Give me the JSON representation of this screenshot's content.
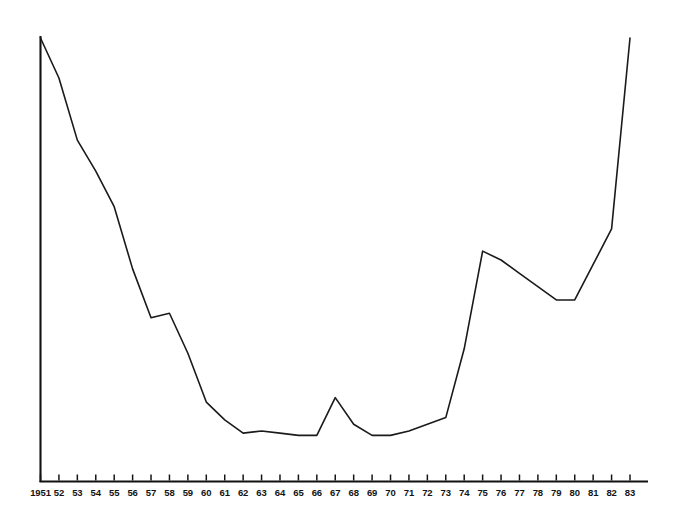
{
  "figure": {
    "background_color": "#ffffff",
    "line_color": "#1a1a1a",
    "axis_color": "#111111",
    "line_width": 1.6,
    "axis_width": 2.0
  },
  "chart_data": {
    "type": "line",
    "title": "",
    "subtitle": "",
    "xlabel": "",
    "ylabel": "",
    "grid": false,
    "legend": null,
    "legend_position": "none",
    "y_axis_labeled": false,
    "y_axis_ticks": [],
    "axis_style": {
      "left_spine": true,
      "bottom_spine": true,
      "top_spine": false,
      "right_spine": false,
      "tick_direction": "up"
    },
    "x_tick_labels": [
      "1951",
      "52",
      "53",
      "54",
      "55",
      "56",
      "57",
      "58",
      "59",
      "60",
      "61",
      "62",
      "63",
      "64",
      "65",
      "66",
      "67",
      "68",
      "69",
      "70",
      "71",
      "72",
      "73",
      "74",
      "75",
      "76",
      "77",
      "78",
      "79",
      "80",
      "81",
      "82",
      "83"
    ],
    "x": [
      1951,
      1952,
      1953,
      1954,
      1955,
      1956,
      1957,
      1958,
      1959,
      1960,
      1961,
      1962,
      1963,
      1964,
      1965,
      1966,
      1967,
      1968,
      1969,
      1970,
      1971,
      1972,
      1973,
      1974,
      1975,
      1976,
      1977,
      1978,
      1979,
      1980,
      1981,
      1982,
      1983
    ],
    "xlim": [
      1951,
      1983
    ],
    "ylim": [
      0,
      100
    ],
    "values": [
      100.0,
      91.0,
      77.0,
      70.0,
      62.0,
      48.0,
      37.0,
      38.0,
      29.0,
      18.0,
      14.0,
      11.0,
      11.5,
      11.0,
      10.5,
      10.5,
      19.0,
      13.0,
      10.5,
      10.5,
      11.5,
      13.0,
      14.5,
      30.0,
      52.0,
      50.0,
      47.0,
      44.0,
      41.0,
      41.0,
      49.0,
      57.0,
      100.0
    ],
    "annotations": [
      {
        "label": "step plateau",
        "x_range": [
          1957,
          1958
        ]
      },
      {
        "label": "spike",
        "x": 1967
      },
      {
        "label": "plateau peak",
        "x_range": [
          1975,
          1976
        ]
      },
      {
        "label": "dip",
        "x_range": [
          1979,
          1980
        ]
      }
    ]
  }
}
